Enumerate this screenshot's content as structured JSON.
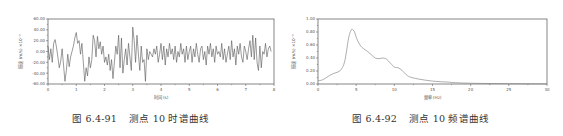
{
  "figures": [
    {
      "caption_number": "图 6.4-91",
      "caption_text": "测点 10 时谱曲线",
      "xlabel": "时间 (s)",
      "ylabel": "振速 (m/s) ×10⁻³"
    },
    {
      "caption_number": "图 6.4-92",
      "caption_text": "测点 10 频谱曲线",
      "xlabel": "频率 (Hz)",
      "ylabel": "振速 (m/s) ×10⁻³"
    }
  ],
  "chart_data": [
    {
      "type": "line",
      "title": "测点 10 时谱曲线",
      "xlabel": "时间 (s)",
      "ylabel": "振速 (m/s) ×10⁻³",
      "xlim": [
        0,
        8
      ],
      "ylim": [
        -60,
        60
      ],
      "xticks": [
        "0",
        "1",
        "2",
        "3",
        "4",
        "5",
        "6",
        "7",
        "8"
      ],
      "yticks": [
        "60.00",
        "40.00",
        "20.00",
        "0.00",
        "-20.00",
        "-40.00",
        "-60.00"
      ],
      "grid": false,
      "description": "Random vibration velocity time history, amplitude mostly within ±40, peak ≈ +45 near t≈3.0 s, minima ≈ -55 near t≈0.6 s, 1.2 s and 3.4 s",
      "series": [
        {
          "name": "velocity",
          "x": [
            0.0,
            0.05,
            0.1,
            0.15,
            0.2,
            0.25,
            0.3,
            0.35,
            0.4,
            0.45,
            0.5,
            0.55,
            0.6,
            0.65,
            0.7,
            0.75,
            0.8,
            0.85,
            0.9,
            0.95,
            1.0,
            1.05,
            1.1,
            1.15,
            1.2,
            1.25,
            1.3,
            1.35,
            1.4,
            1.45,
            1.5,
            1.55,
            1.6,
            1.65,
            1.7,
            1.75,
            1.8,
            1.85,
            1.9,
            1.95,
            2.0,
            2.05,
            2.1,
            2.15,
            2.2,
            2.25,
            2.3,
            2.35,
            2.4,
            2.45,
            2.5,
            2.55,
            2.6,
            2.65,
            2.7,
            2.75,
            2.8,
            2.85,
            2.9,
            2.95,
            3.0,
            3.05,
            3.1,
            3.15,
            3.2,
            3.25,
            3.3,
            3.35,
            3.4,
            3.45,
            3.5,
            3.55,
            3.6,
            3.65,
            3.7,
            3.75,
            3.8,
            3.85,
            3.9,
            3.95,
            4.0,
            4.05,
            4.1,
            4.15,
            4.2,
            4.25,
            4.3,
            4.35,
            4.4,
            4.45,
            4.5,
            4.55,
            4.6,
            4.65,
            4.7,
            4.75,
            4.8,
            4.85,
            4.9,
            4.95,
            5.0,
            5.05,
            5.1,
            5.15,
            5.2,
            5.25,
            5.3,
            5.35,
            5.4,
            5.45,
            5.5,
            5.55,
            5.6,
            5.65,
            5.7,
            5.75,
            5.8,
            5.85,
            5.9,
            5.95,
            6.0,
            6.05,
            6.1,
            6.15,
            6.2,
            6.25,
            6.3,
            6.35,
            6.4,
            6.45,
            6.5,
            6.55,
            6.6,
            6.65,
            6.7,
            6.75,
            6.8,
            6.85,
            6.9,
            6.95,
            7.0,
            7.05,
            7.1,
            7.15,
            7.2,
            7.25,
            7.3,
            7.35,
            7.4,
            7.45,
            7.5,
            7.55,
            7.6,
            7.65,
            7.7,
            7.75,
            7.8,
            7.85,
            7.9,
            7.95,
            8.0
          ],
          "values": [
            10,
            -15,
            5,
            -20,
            15,
            22,
            8,
            -10,
            -30,
            -18,
            5,
            -25,
            -55,
            -35,
            -5,
            -28,
            -10,
            0,
            10,
            25,
            35,
            15,
            20,
            -5,
            15,
            -20,
            -55,
            -30,
            -45,
            -10,
            -30,
            -15,
            30,
            20,
            -10,
            28,
            5,
            18,
            -5,
            10,
            -20,
            -10,
            -25,
            -5,
            -35,
            -15,
            -50,
            -20,
            10,
            -5,
            30,
            -30,
            25,
            -40,
            -15,
            5,
            -25,
            15,
            -10,
            -35,
            45,
            20,
            -20,
            30,
            -5,
            -35,
            10,
            -20,
            -15,
            -55,
            5,
            -15,
            0,
            -5,
            -10,
            5,
            -5,
            10,
            -20,
            -5,
            15,
            -15,
            10,
            -25,
            5,
            -10,
            15,
            -5,
            5,
            -15,
            10,
            -20,
            0,
            -10,
            15,
            -5,
            5,
            -20,
            10,
            -15,
            0,
            10,
            -20,
            5,
            -10,
            15,
            -5,
            -20,
            5,
            10,
            -15,
            0,
            -25,
            10,
            -5,
            15,
            -10,
            5,
            -20,
            10,
            -5,
            0,
            -10,
            15,
            -15,
            5,
            -20,
            -5,
            10,
            -15,
            20,
            -10,
            5,
            -25,
            10,
            -5,
            15,
            -10,
            -20,
            10,
            0,
            -15,
            5,
            20,
            -10,
            30,
            -15,
            25,
            -20,
            -35,
            10,
            -30,
            0,
            -5,
            15,
            -10,
            5,
            10,
            0
          ]
        }
      ]
    },
    {
      "type": "line",
      "title": "测点 10 频谱曲线",
      "xlabel": "频率 (Hz)",
      "ylabel": "振速 (m/s) ×10⁻³",
      "xlim": [
        0,
        30
      ],
      "ylim": [
        0,
        1.0
      ],
      "xticks": [
        "0",
        "5",
        "10",
        "15",
        "20",
        "25",
        "30"
      ],
      "yticks": [
        "1.00",
        "0.80",
        "0.60",
        "0.40",
        "0.20",
        "0.00"
      ],
      "grid": false,
      "description": "Amplitude spectrum, dominant peak ≈ 0.84 at ≈ 4.5 Hz, shoulder ≈ 0.38 near 8–9 Hz, decays to ~0 beyond 18 Hz",
      "series": [
        {
          "name": "amplitude",
          "x": [
            0,
            0.5,
            1.0,
            1.5,
            2.0,
            2.5,
            3.0,
            3.5,
            4.0,
            4.3,
            4.5,
            4.8,
            5.0,
            5.5,
            6.0,
            6.5,
            7.0,
            7.5,
            8.0,
            8.5,
            9.0,
            9.5,
            10.0,
            10.5,
            11.0,
            11.5,
            12.0,
            13.0,
            14.0,
            15.0,
            16.0,
            17.0,
            18.0,
            20.0,
            22.0,
            25.0,
            28.0,
            30.0
          ],
          "values": [
            0.05,
            0.06,
            0.09,
            0.13,
            0.16,
            0.18,
            0.22,
            0.35,
            0.7,
            0.82,
            0.84,
            0.8,
            0.72,
            0.6,
            0.54,
            0.5,
            0.45,
            0.4,
            0.39,
            0.4,
            0.38,
            0.32,
            0.26,
            0.25,
            0.21,
            0.15,
            0.11,
            0.08,
            0.06,
            0.045,
            0.035,
            0.03,
            0.02,
            0.012,
            0.008,
            0.005,
            0.003,
            0.002
          ]
        }
      ]
    }
  ]
}
